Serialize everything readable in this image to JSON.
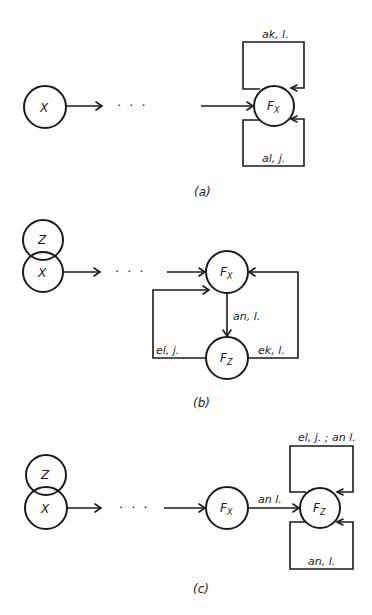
{
  "panels": {
    "a": {
      "caption": "(a)",
      "nodes": {
        "x": "X",
        "fx_main": "F",
        "fx_sub": "X"
      },
      "dots": "· · ·",
      "edges": {
        "top_loop": "ak, l.",
        "bottom_loop": "al, j."
      }
    },
    "b": {
      "caption": "(b)",
      "nodes": {
        "z": "Z",
        "x": "X",
        "fx_main": "F",
        "fx_sub": "X",
        "fz_main": "F",
        "fz_sub": "Z"
      },
      "dots": "· · ·",
      "edges": {
        "fx_to_fz": "an, l.",
        "left_loop": "el, j.",
        "right_loop": "ek, l."
      }
    },
    "c": {
      "caption": "(c)",
      "nodes": {
        "z": "Z",
        "x": "X",
        "fx_main": "F",
        "fx_sub": "X",
        "fz_main": "F",
        "fz_sub": "Z"
      },
      "dots": "· · ·",
      "edges": {
        "fx_to_fz": "an l.",
        "top_loop": "el, j. ; an l.",
        "bottom_loop": "an, l."
      }
    }
  },
  "colors": {
    "ink": "#1a1a1a",
    "background": "#ffffff"
  }
}
